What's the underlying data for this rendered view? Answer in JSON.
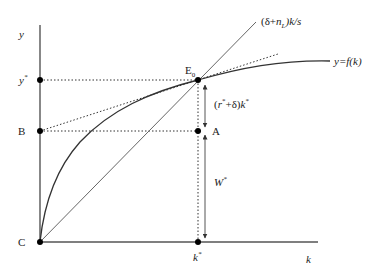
{
  "diagram": {
    "type": "solow-growth-equilibrium",
    "colors": {
      "axis": "#555555",
      "curve": "#333333",
      "line": "#666666",
      "dotted": "#333333",
      "point": "#000000",
      "text": "#222222"
    },
    "axes": {
      "y_label": "y",
      "x_label": "k"
    },
    "points": {
      "y_star": "y",
      "y_star_sup": "*",
      "B": "B",
      "C": "C",
      "E0_main": "E",
      "E0_sub": "0",
      "A": "A",
      "k_star": "k",
      "k_star_sup": "*"
    },
    "curves": {
      "line_label_open": "(δ+",
      "line_label_n": "n",
      "line_label_sub": "L",
      "line_label_close": ")k/s",
      "production_label": "y=f(k)"
    },
    "annotations": {
      "rental_open": "(",
      "rental_r": "r",
      "rental_sup": "*",
      "rental_mid": "+δ)",
      "rental_k": "k",
      "rental_k_sup": "*",
      "wage_W": "W",
      "wage_sup": "*"
    }
  }
}
